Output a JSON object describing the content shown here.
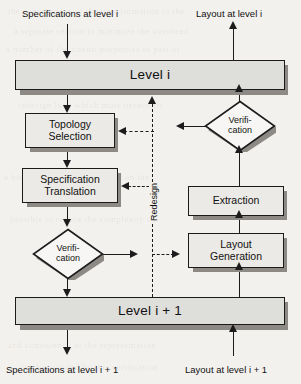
{
  "diagram": {
    "background_color": "#f3f1ee",
    "node_fill": "#e8e6e2",
    "level_fill": "#dededa",
    "line_color": "#1c1c1c",
    "shadow_color": "#8d8a86"
  },
  "captions": {
    "spec_in": "Specifications at level i",
    "layout_out": "Layout at level i",
    "spec_out": "Specifications at level i + 1",
    "layout_in": "Layout at level i + 1",
    "redesign": "Redesign"
  },
  "nodes": {
    "level_i": {
      "label": "Level i",
      "kind": "level-bar"
    },
    "level_i1": {
      "label": "Level i + 1",
      "kind": "level-bar"
    },
    "topology_selection": {
      "line1": "Topology",
      "line2": "Selection",
      "kind": "process"
    },
    "specification_translation": {
      "line1": "Specification",
      "line2": "Translation",
      "kind": "process"
    },
    "extraction": {
      "line1": "Extraction",
      "line2": "",
      "kind": "process"
    },
    "layout_generation": {
      "line1": "Layout",
      "line2": "Generation",
      "kind": "process"
    },
    "verification_left": {
      "line1": "Verifi-",
      "line2": "cation",
      "kind": "decision"
    },
    "verification_right": {
      "line1": "Verifi-",
      "line2": "cation",
      "kind": "decision"
    }
  },
  "edges": [
    {
      "from": "spec_in",
      "to": "level_i",
      "style": "solid",
      "arrow": "down"
    },
    {
      "from": "level_i",
      "to": "topology_selection",
      "style": "solid",
      "arrow": "down"
    },
    {
      "from": "topology_selection",
      "to": "specification_translation",
      "style": "solid",
      "arrow": "down"
    },
    {
      "from": "specification_translation",
      "to": "verification_left",
      "style": "solid",
      "arrow": "down"
    },
    {
      "from": "verification_left",
      "to": "level_i1",
      "style": "solid",
      "arrow": "down"
    },
    {
      "from": "verification_left",
      "to": "redesign_bus",
      "style": "solid",
      "arrow": "right"
    },
    {
      "from": "level_i1",
      "to": "spec_out",
      "style": "solid",
      "arrow": "down"
    },
    {
      "from": "layout_in",
      "to": "level_i1",
      "style": "solid",
      "arrow": "up"
    },
    {
      "from": "level_i1",
      "to": "layout_generation",
      "style": "solid",
      "arrow": "up"
    },
    {
      "from": "layout_generation",
      "to": "extraction",
      "style": "solid",
      "arrow": "up"
    },
    {
      "from": "extraction",
      "to": "verification_right",
      "style": "solid",
      "arrow": "up"
    },
    {
      "from": "verification_right",
      "to": "level_i",
      "style": "solid",
      "arrow": "up"
    },
    {
      "from": "verification_right",
      "to": "redesign_bus",
      "style": "solid",
      "arrow": "left"
    },
    {
      "from": "level_i",
      "to": "layout_out",
      "style": "solid",
      "arrow": "up"
    },
    {
      "from": "redesign_bus",
      "to": "topology_selection",
      "style": "dashed",
      "arrow": "left"
    },
    {
      "from": "redesign_bus",
      "to": "specification_translation",
      "style": "dashed",
      "arrow": "left"
    },
    {
      "from": "redesign_bus",
      "to": "layout_generation",
      "style": "dashed",
      "arrow": "right"
    },
    {
      "from": "redesign_bus",
      "to": "level_i",
      "style": "dashed",
      "arrow": "up"
    }
  ],
  "bleed_text": [
    "the construction of the transformation to the",
    "a separate section to minimize the overhead",
    "a number of the circuit properties of part of",
    "redesign loop which must iteratively",
    "a hierarchical approach based on the",
    "possible to reduce the complexity to",
    "and consistency of the representation",
    "can be avoided by this verification"
  ]
}
